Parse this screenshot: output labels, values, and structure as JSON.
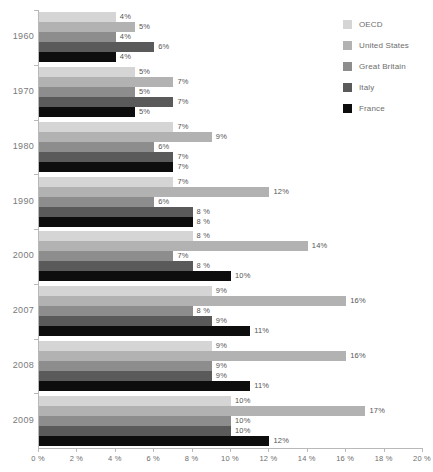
{
  "chart_data": {
    "type": "bar",
    "orientation": "horizontal",
    "title": "",
    "subtitle": "",
    "xlabel": "",
    "ylabel": "",
    "xlim": [
      0,
      20
    ],
    "xtick_labels": [
      "0 %",
      "2 %",
      "4 %",
      "6 %",
      "8 %",
      "10 %",
      "12 %",
      "14 %",
      "16 %",
      "18 %",
      "20 %"
    ],
    "xticks": [
      0,
      2,
      4,
      6,
      8,
      10,
      12,
      14,
      16,
      18,
      20
    ],
    "grid": false,
    "legend_position": "right",
    "value_suffix": "%",
    "categories": [
      "1960",
      "1970",
      "1980",
      "1990",
      "2000",
      "2007",
      "2008",
      "2009"
    ],
    "series": [
      {
        "name": "OECD",
        "color": "#d5d5d5",
        "values": [
          4,
          5,
          7,
          7,
          8,
          9,
          9,
          10
        ],
        "labels": [
          "4%",
          "5%",
          "7%",
          "7%",
          "8 %",
          "9%",
          "9%",
          "10%"
        ]
      },
      {
        "name": "United States",
        "color": "#b2b2b2",
        "values": [
          5,
          7,
          9,
          12,
          14,
          16,
          16,
          17
        ],
        "labels": [
          "5%",
          "7%",
          "9%",
          "12%",
          "14%",
          "16%",
          "16%",
          "17%"
        ]
      },
      {
        "name": "Great Britain",
        "color": "#8d8d8d",
        "values": [
          4,
          5,
          6,
          6,
          7,
          8,
          9,
          10
        ],
        "labels": [
          "4%",
          "5%",
          "6%",
          "6%",
          "7%",
          "8 %",
          "9%",
          "10%"
        ]
      },
      {
        "name": "Italy",
        "color": "#5a5a5a",
        "values": [
          6,
          7,
          7,
          8,
          8,
          9,
          9,
          10
        ],
        "labels": [
          "6%",
          "7%",
          "7%",
          "8 %",
          "8 %",
          "9%",
          "9%",
          "10%"
        ]
      },
      {
        "name": "France",
        "color": "#0d0d0d",
        "values": [
          4,
          5,
          7,
          8,
          10,
          11,
          11,
          12
        ],
        "labels": [
          "4%",
          "5%",
          "7%",
          "8 %",
          "10%",
          "11%",
          "11%",
          "12%"
        ]
      }
    ]
  },
  "legend": {
    "items": [
      {
        "label": "OECD",
        "color": "#d5d5d5"
      },
      {
        "label": "United States",
        "color": "#b2b2b2"
      },
      {
        "label": "Great Britain",
        "color": "#8d8d8d"
      },
      {
        "label": "Italy",
        "color": "#5a5a5a"
      },
      {
        "label": "France",
        "color": "#0d0d0d"
      }
    ]
  },
  "axis": {
    "x_tick_labels": [
      "0 %",
      "2 %",
      "4 %",
      "6 %",
      "8 %",
      "10 %",
      "12 %",
      "14 %",
      "16 %",
      "18 %",
      "20 %"
    ],
    "y_group_labels": [
      "1960",
      "1970",
      "1980",
      "1990",
      "2000",
      "2007",
      "2008",
      "2009"
    ]
  },
  "colors": {
    "axis_line": "#b9b9b9",
    "tick_text": "#6d6d6d",
    "label_text": "#555555",
    "group_text": "#7a7a7a",
    "background": "#ffffff"
  }
}
